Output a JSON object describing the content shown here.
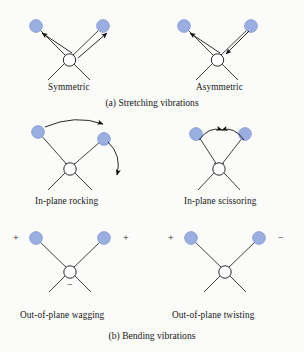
{
  "figure": {
    "background_color": "#fbfbf9",
    "atom_color": "#9aaee0",
    "atom_stroke_color": "#7f95cd",
    "bond_color": "#2b2b2b",
    "arrow_color": "#111111",
    "hub_fill": "#ffffff",
    "hub_stroke": "#2b2b2b"
  },
  "sections": [
    {
      "id": "stretching",
      "caption": "(a) Stretching vibrations",
      "caption_y": 97,
      "diagrams": [
        {
          "id": "symmetric",
          "label": "Symmetric",
          "label_x": 48,
          "label_y": 82,
          "signs": []
        },
        {
          "id": "asymmetric",
          "label": "Asymmetric",
          "label_x": 196,
          "label_y": 82,
          "signs": []
        }
      ]
    },
    {
      "id": "bending",
      "caption": "(b) Bending vibrations",
      "caption_y": 330,
      "diagrams": [
        {
          "id": "in-plane-rocking",
          "label": "In-plane rocking",
          "label_x": 35,
          "label_y": 196,
          "signs": []
        },
        {
          "id": "in-plane-scissoring",
          "label": "In-plane scissoring",
          "label_x": 184,
          "label_y": 196,
          "signs": []
        },
        {
          "id": "out-of-plane-wagging",
          "label": "Out-of-plane wagging",
          "label_x": 20,
          "label_y": 310,
          "signs": [
            {
              "text": "+",
              "x": 13,
              "y": 237
            },
            {
              "text": "+",
              "x": 123,
              "y": 237
            },
            {
              "text": "−",
              "x": 71,
              "y": 285
            }
          ]
        },
        {
          "id": "out-of-plane-twisting",
          "label": "Out-of-plane twisting",
          "label_x": 172,
          "label_y": 310,
          "signs": [
            {
              "text": "+",
              "x": 168,
              "y": 237
            },
            {
              "text": "−",
              "x": 278,
              "y": 237
            }
          ]
        }
      ]
    }
  ]
}
